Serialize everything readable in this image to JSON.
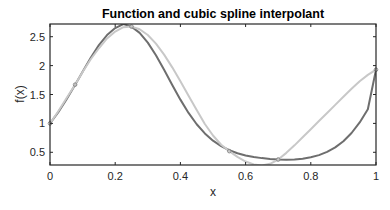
{
  "chart_data": {
    "type": "line",
    "title": "Function and cubic spline interpolant",
    "xlabel": "x",
    "ylabel": "f(x)",
    "xlim": [
      0,
      1
    ],
    "ylim": [
      0.28,
      2.72
    ],
    "xticks": [
      0,
      0.2,
      0.4,
      0.6,
      0.8,
      1
    ],
    "xtick_labels": [
      "0",
      "0.2",
      "0.4",
      "0.6",
      "0.8",
      "1"
    ],
    "yticks": [
      0.5,
      1,
      1.5,
      2,
      2.5
    ],
    "ytick_labels": [
      "0.5",
      "1",
      "1.5",
      "2",
      "2.5"
    ],
    "grid": false,
    "legend": null,
    "series": [
      {
        "name": "f(x) = exp(sin(7x))",
        "color": "#6e6e6e",
        "x": [
          0,
          0.025,
          0.05,
          0.075,
          0.1,
          0.125,
          0.15,
          0.175,
          0.2,
          0.225,
          0.25,
          0.275,
          0.3,
          0.325,
          0.35,
          0.375,
          0.4,
          0.425,
          0.45,
          0.475,
          0.5,
          0.525,
          0.55,
          0.575,
          0.6,
          0.625,
          0.65,
          0.675,
          0.7,
          0.725,
          0.75,
          0.775,
          0.8,
          0.825,
          0.85,
          0.875,
          0.9,
          0.925,
          0.95,
          0.975,
          1
        ],
        "y": [
          1.0,
          1.191,
          1.409,
          1.648,
          1.895,
          2.136,
          2.354,
          2.529,
          2.649,
          2.718,
          2.675,
          2.567,
          2.398,
          2.178,
          1.927,
          1.665,
          1.411,
          1.181,
          0.985,
          0.826,
          0.701,
          0.606,
          0.535,
          0.484,
          0.446,
          0.419,
          0.399,
          0.385,
          0.375,
          0.372,
          0.376,
          0.389,
          0.413,
          0.451,
          0.507,
          0.585,
          0.692,
          0.834,
          1.016,
          1.245,
          1.929
        ]
      },
      {
        "name": "cubic spline interpolant",
        "color": "#c8c8c8",
        "knots_x": [
          0,
          0.077,
          0.25,
          0.55,
          0.7,
          1
        ],
        "knots_y": [
          1.0,
          1.67,
          2.675,
          0.52,
          0.375,
          1.929
        ],
        "x": [
          0,
          0.025,
          0.05,
          0.077,
          0.1,
          0.125,
          0.15,
          0.175,
          0.2,
          0.225,
          0.25,
          0.275,
          0.3,
          0.325,
          0.35,
          0.375,
          0.4,
          0.425,
          0.45,
          0.475,
          0.5,
          0.525,
          0.55,
          0.575,
          0.6,
          0.625,
          0.65,
          0.675,
          0.7,
          0.725,
          0.75,
          0.775,
          0.8,
          0.825,
          0.85,
          0.875,
          0.9,
          0.925,
          0.95,
          0.975,
          1
        ],
        "y": [
          1.0,
          1.205,
          1.43,
          1.67,
          1.89,
          2.11,
          2.3,
          2.47,
          2.59,
          2.665,
          2.675,
          2.63,
          2.53,
          2.38,
          2.19,
          1.97,
          1.73,
          1.48,
          1.23,
          0.99,
          0.79,
          0.63,
          0.52,
          0.42,
          0.34,
          0.29,
          0.27,
          0.3,
          0.375,
          0.49,
          0.62,
          0.76,
          0.9,
          1.04,
          1.18,
          1.32,
          1.46,
          1.6,
          1.73,
          1.84,
          1.929
        ]
      }
    ],
    "markers": {
      "x": [
        0,
        0.077,
        0.25,
        0.55,
        0.7,
        1
      ],
      "y": [
        1.0,
        1.67,
        2.675,
        0.52,
        0.375,
        1.929
      ],
      "color": "#8a8a8a"
    }
  }
}
